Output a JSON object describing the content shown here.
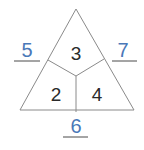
{
  "diagram": {
    "type": "number-triangle",
    "colors": {
      "outline": "#8a8a8a",
      "inner_text": "#2a2a2a",
      "answer_text": "#4a78b8",
      "answer_line": "#4a4a4a"
    },
    "inner_numbers": {
      "top": "3",
      "bottom_left": "2",
      "bottom_right": "4"
    },
    "outer_answers": {
      "left": "5",
      "right": "7",
      "bottom": "6"
    }
  }
}
